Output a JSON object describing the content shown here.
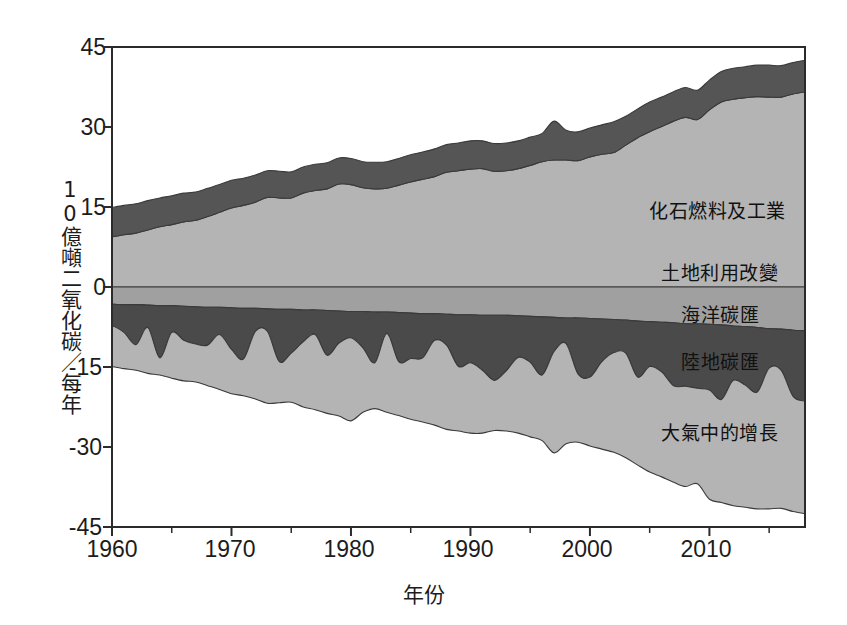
{
  "chart_data": {
    "type": "area",
    "title": "",
    "xlabel": "年份",
    "ylabel": "10億噸二氧化碳／每年",
    "xlim": [
      1960,
      2018
    ],
    "ylim": [
      -45,
      45
    ],
    "grid": false,
    "legend_position": "inline-right",
    "xticks": [
      "1960",
      "1970",
      "1980",
      "1990",
      "2000",
      "2010"
    ],
    "xtick_values": [
      1960,
      1970,
      1980,
      1990,
      2000,
      2010
    ],
    "yticks": [
      "45",
      "30",
      "15",
      "0",
      "-15",
      "-30",
      "-45"
    ],
    "ytick_values": [
      45,
      30,
      15,
      0,
      -15,
      -30,
      -45
    ],
    "x": [
      1960,
      1961,
      1962,
      1963,
      1964,
      1965,
      1966,
      1967,
      1968,
      1969,
      1970,
      1971,
      1972,
      1973,
      1974,
      1975,
      1976,
      1977,
      1978,
      1979,
      1980,
      1981,
      1982,
      1983,
      1984,
      1985,
      1986,
      1987,
      1988,
      1989,
      1990,
      1991,
      1992,
      1993,
      1994,
      1995,
      1996,
      1997,
      1998,
      1999,
      2000,
      2001,
      2002,
      2003,
      2004,
      2005,
      2006,
      2007,
      2008,
      2009,
      2010,
      2011,
      2012,
      2013,
      2014,
      2015,
      2016,
      2017,
      2018
    ],
    "series": [
      {
        "name": "化石燃料及工業",
        "color": "#b4b4b4",
        "direction": "positive",
        "values": [
          9.4,
          9.8,
          10.1,
          10.7,
          11.3,
          11.7,
          12.2,
          12.5,
          13.2,
          14.0,
          14.8,
          15.3,
          15.9,
          16.8,
          16.7,
          16.7,
          17.6,
          18.1,
          18.4,
          19.3,
          19.2,
          18.6,
          18.4,
          18.5,
          19.1,
          19.7,
          20.2,
          20.7,
          21.5,
          21.8,
          22.1,
          22.2,
          21.7,
          21.8,
          22.2,
          22.8,
          23.5,
          23.8,
          23.8,
          23.7,
          24.4,
          24.9,
          25.2,
          26.6,
          28.0,
          29.1,
          30.1,
          31.1,
          31.8,
          31.4,
          33.2,
          34.7,
          35.2,
          35.5,
          35.7,
          35.6,
          35.6,
          36.2,
          36.6
        ]
      },
      {
        "name": "土地利用改變",
        "color": "#555555",
        "direction": "positive",
        "values": [
          5.5,
          5.5,
          5.5,
          5.5,
          5.4,
          5.4,
          5.4,
          5.3,
          5.3,
          5.2,
          5.2,
          5.1,
          5.1,
          5.0,
          5.0,
          4.9,
          4.9,
          4.9,
          4.9,
          4.9,
          4.9,
          4.9,
          5.0,
          5.0,
          5.0,
          5.1,
          5.1,
          5.2,
          5.2,
          5.2,
          5.3,
          5.2,
          5.2,
          5.2,
          5.2,
          5.3,
          5.3,
          7.3,
          5.6,
          5.4,
          5.4,
          5.5,
          5.8,
          5.4,
          5.4,
          5.6,
          5.5,
          5.5,
          5.6,
          5.5,
          5.6,
          5.7,
          5.8,
          5.8,
          5.9,
          6.0,
          5.9,
          5.9,
          5.9
        ]
      },
      {
        "name": "海洋碳匯",
        "color": "#a0a0a0",
        "direction": "negative",
        "values": [
          -3.2,
          -3.3,
          -3.3,
          -3.4,
          -3.5,
          -3.5,
          -3.6,
          -3.7,
          -3.8,
          -3.8,
          -3.9,
          -4.0,
          -4.0,
          -4.1,
          -4.2,
          -4.2,
          -4.3,
          -4.3,
          -4.4,
          -4.5,
          -4.6,
          -4.6,
          -4.7,
          -4.7,
          -4.8,
          -4.9,
          -5.0,
          -5.0,
          -5.1,
          -5.2,
          -5.2,
          -5.3,
          -5.3,
          -5.3,
          -5.4,
          -5.5,
          -5.6,
          -5.7,
          -5.8,
          -5.8,
          -5.9,
          -6.0,
          -6.1,
          -6.2,
          -6.4,
          -6.5,
          -6.6,
          -6.7,
          -6.9,
          -6.9,
          -7.0,
          -7.1,
          -7.3,
          -7.4,
          -7.6,
          -7.8,
          -7.9,
          -8.1,
          -8.2
        ]
      },
      {
        "name": "陸地碳匯",
        "color": "#4a4a4a",
        "direction": "negative",
        "values": [
          -4.0,
          -5.2,
          -7.5,
          -4.2,
          -9.8,
          -5.0,
          -6.4,
          -7.0,
          -7.1,
          -5.1,
          -7.8,
          -9.5,
          -4.3,
          -4.2,
          -9.8,
          -8.2,
          -6.0,
          -4.6,
          -8.4,
          -6.0,
          -4.9,
          -6.8,
          -9.5,
          -4.0,
          -9.2,
          -8.5,
          -8.3,
          -5.0,
          -5.8,
          -9.7,
          -9.0,
          -10.3,
          -12.2,
          -10.4,
          -7.8,
          -8.6,
          -10.9,
          -6.4,
          -4.8,
          -10.5,
          -11.0,
          -8.0,
          -6.2,
          -6.2,
          -10.5,
          -8.4,
          -9.3,
          -11.8,
          -11.7,
          -12.1,
          -12.3,
          -14.0,
          -10.2,
          -11.0,
          -12.1,
          -7.4,
          -7.7,
          -12.4,
          -13.2
        ]
      },
      {
        "name": "大氣中的增長",
        "color": "#b4b4b4",
        "direction": "negative",
        "values": [
          -7.7,
          -6.8,
          -4.8,
          -8.6,
          -3.2,
          -8.6,
          -7.6,
          -7.1,
          -7.6,
          -10.3,
          -8.3,
          -6.9,
          -12.7,
          -13.5,
          -7.7,
          -9.2,
          -12.2,
          -14.1,
          -10.9,
          -13.7,
          -15.6,
          -12.1,
          -8.6,
          -14.8,
          -10.1,
          -11.4,
          -12.0,
          -15.9,
          -15.8,
          -12.1,
          -13.2,
          -11.8,
          -9.4,
          -11.3,
          -14.2,
          -14.0,
          -12.3,
          -19.0,
          -18.8,
          -12.8,
          -12.9,
          -16.4,
          -18.7,
          -19.6,
          -16.5,
          -19.8,
          -19.7,
          -18.1,
          -18.8,
          -17.9,
          -20.5,
          -19.3,
          -23.5,
          -22.9,
          -21.9,
          -26.4,
          -25.9,
          -21.6,
          -21.1
        ]
      }
    ]
  },
  "labels": {
    "fossil": "化石燃料及工業",
    "landuse": "土地利用改變",
    "ocean": "海洋碳匯",
    "landsink": "陸地碳匯",
    "atmosphere": "大氣中的增長"
  },
  "colors": {
    "light_gray": "#b4b4b4",
    "medium_gray": "#a0a0a0",
    "dark_gray": "#555555",
    "darker_gray": "#4a4a4a",
    "axis": "#2b2b2b",
    "background": "#ffffff"
  }
}
